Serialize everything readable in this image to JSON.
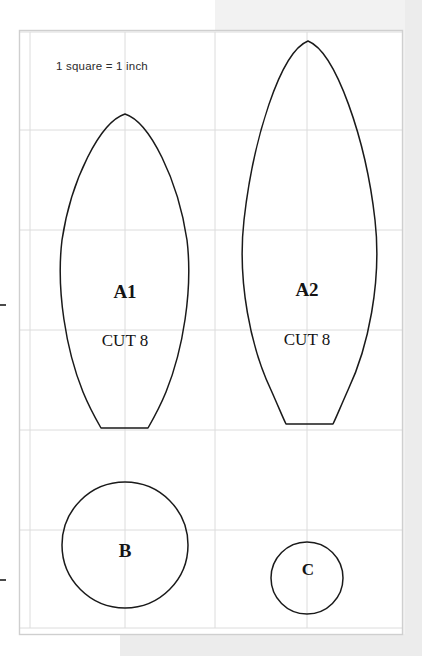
{
  "document": {
    "type": "sewing-pattern-template",
    "scale_note": "1 square = 1 inch",
    "grid": {
      "unit_label": "1 inch",
      "cell_size_px": 96,
      "vertical_lines_px": [
        30,
        125,
        215,
        307,
        402
      ],
      "horizontal_lines_px": [
        32,
        130,
        230,
        330,
        430,
        530,
        628
      ],
      "line_color": "#d9d9d9",
      "border_color": "#c9c9c9"
    },
    "background": {
      "page_color": "#ffffff",
      "scan_shade_color": "#ececec",
      "scan_shade_light": "#f2f2f2"
    },
    "ink_color": "#1a1a1a"
  },
  "pieces": [
    {
      "id": "A1",
      "name": "A1",
      "cut_label": "CUT 8",
      "shape": "pointed-oval-with-flat-tail",
      "width_inches": 1.4,
      "height_inches": 3.3,
      "apex_px": {
        "x": 125,
        "y": 114
      },
      "widest_px": {
        "left": 60,
        "right": 190,
        "y": 260
      },
      "flat_bottom_px": {
        "left": 101,
        "right": 148,
        "y": 428
      }
    },
    {
      "id": "A2",
      "name": "A2",
      "cut_label": "CUT 8",
      "shape": "pointed-oval-with-flat-tail",
      "width_inches": 1.5,
      "height_inches": 4.0,
      "apex_px": {
        "x": 308,
        "y": 41
      },
      "widest_px": {
        "left": 236,
        "right": 377,
        "y": 240
      },
      "flat_bottom_px": {
        "left": 286,
        "right": 333,
        "y": 424
      }
    },
    {
      "id": "B",
      "name": "B",
      "cut_label": "",
      "shape": "circle",
      "diameter_inches": 1.35,
      "center_px": {
        "x": 125,
        "y": 545
      },
      "radius_px": 63
    },
    {
      "id": "C",
      "name": "C",
      "cut_label": "",
      "shape": "circle",
      "diameter_inches": 0.75,
      "center_px": {
        "x": 307,
        "y": 578
      },
      "radius_px": 36
    }
  ],
  "edge_marks": [
    {
      "name": "left-tick-upper",
      "x": 2,
      "y": 305
    },
    {
      "name": "left-tick-lower",
      "x": 2,
      "y": 580
    }
  ]
}
